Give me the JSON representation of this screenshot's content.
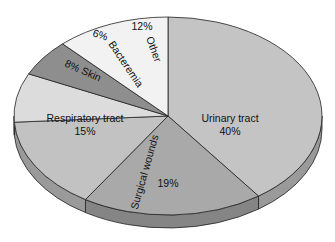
{
  "chart_data": {
    "type": "pie",
    "style": "3d-tilted",
    "title": "",
    "start_angle": "12 o'clock, clockwise",
    "slices": [
      {
        "label": "Urinary tract",
        "value": 40,
        "text": "40%",
        "color": "#c4c4c4",
        "side_color": "#9a9a9a"
      },
      {
        "label": "Surgical wounds",
        "value": 19,
        "text": "19%",
        "color": "#a9a9a9",
        "side_color": "#858585"
      },
      {
        "label": "Respiratory tract",
        "value": 15,
        "text": "15%",
        "color": "#c2c2c2",
        "side_color": "#9a9a9a"
      },
      {
        "label": "Skin",
        "value": 8,
        "text": "8%",
        "color": "#dcdcdc",
        "side_color": "#b0b0b0"
      },
      {
        "label": "Bacteremia",
        "value": 6,
        "text": "6%",
        "color": "#8e8e8e",
        "side_color": "#6e6e6e"
      },
      {
        "label": "Other",
        "value": 12,
        "text": "12%",
        "color": "#f2f2f2",
        "side_color": "#c8c8c8"
      }
    ],
    "labels": {
      "urinary": {
        "line1": "Urinary tract",
        "line2": "40%"
      },
      "surgical": {
        "line1": "Surgical wounds",
        "line2": "19%"
      },
      "respiratory": {
        "line1": "Respiratory tract",
        "line2": "15%"
      },
      "skin": "8% Skin",
      "bacteremia_pct": "6%",
      "bacteremia": "Bacteremia",
      "other_pct": "12%",
      "other": "Other"
    }
  }
}
